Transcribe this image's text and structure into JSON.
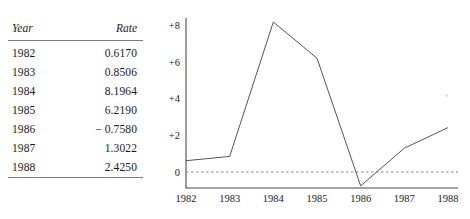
{
  "table": {
    "headers": {
      "year": "Year",
      "rate": "Rate"
    },
    "rows": [
      {
        "year": "1982",
        "rate": "0.6170"
      },
      {
        "year": "1983",
        "rate": "0.8506"
      },
      {
        "year": "1984",
        "rate": "8.1964"
      },
      {
        "year": "1985",
        "rate": "6.2190"
      },
      {
        "year": "1986",
        "rate": "− 0.7580"
      },
      {
        "year": "1987",
        "rate": "1.3022"
      },
      {
        "year": "1988",
        "rate": "2.4250"
      }
    ]
  },
  "chart_data": {
    "type": "line",
    "title": "",
    "xlabel": "",
    "ylabel": "",
    "categories": [
      "1982",
      "1983",
      "1984",
      "1985",
      "1986",
      "1987",
      "1988"
    ],
    "x": [
      1982,
      1983,
      1984,
      1985,
      1986,
      1987,
      1988
    ],
    "values": [
      0.617,
      0.8506,
      8.1964,
      6.219,
      -0.758,
      1.3022,
      2.425
    ],
    "series": [
      {
        "name": "Rate",
        "values": [
          0.617,
          0.8506,
          8.1964,
          6.219,
          -0.758,
          1.3022,
          2.425
        ]
      }
    ],
    "ytick_labels": [
      "+8",
      "+6",
      "+4",
      "+2",
      "0"
    ],
    "ytick_values": [
      8,
      6,
      4,
      2,
      0
    ],
    "xtick_labels": [
      "1982",
      "1983",
      "1984",
      "1985",
      "1986",
      "1987",
      "1988"
    ],
    "ylim": [
      -1.4,
      8.8
    ],
    "xlim": [
      1982,
      1988
    ],
    "grid": false,
    "legend": false,
    "zero_reference_line": true,
    "line_color": "#555555",
    "axis_color": "#4a4a4a",
    "zero_line_color": "#8a8a8a"
  }
}
